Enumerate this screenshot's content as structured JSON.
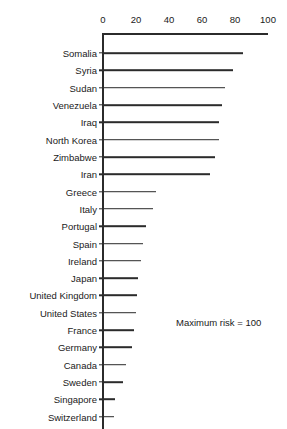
{
  "chart_data": {
    "type": "bar",
    "orientation": "horizontal",
    "title": "",
    "subtitle": "",
    "xlabel": "",
    "ylabel": "",
    "xlim": [
      0,
      100
    ],
    "grid": false,
    "legend": null,
    "annotations": [
      "Maximum risk = 100"
    ],
    "axis_ticks": [
      "0",
      "20",
      "40",
      "60",
      "80",
      "100"
    ],
    "axis_tick_values": [
      0,
      20,
      40,
      60,
      80,
      100
    ],
    "reference_line": {
      "label": "Maximum risk",
      "value": 100
    },
    "categories": [
      "Somalia",
      "Syria",
      "Sudan",
      "Venezuela",
      "Iraq",
      "North Korea",
      "Zimbabwe",
      "Iran",
      "Greece",
      "Italy",
      "Portugal",
      "Spain",
      "Ireland",
      "Japan",
      "United Kingdom",
      "United States",
      "France",
      "Germany",
      "Canada",
      "Sweden",
      "Singapore",
      "Switzerland"
    ],
    "values": [
      85,
      79,
      74,
      72,
      70,
      70,
      68,
      65,
      32,
      30,
      26,
      24,
      23,
      21,
      20.5,
      20,
      19,
      17.5,
      14,
      12,
      7,
      6.5
    ],
    "colors": {
      "bar": "#2b2b2b",
      "axis": "#2b2b2b",
      "background": "#ffffff",
      "text": "#1a1a1a"
    }
  },
  "annotation": {
    "maximum_risk_note": "Maximum risk = 100"
  }
}
